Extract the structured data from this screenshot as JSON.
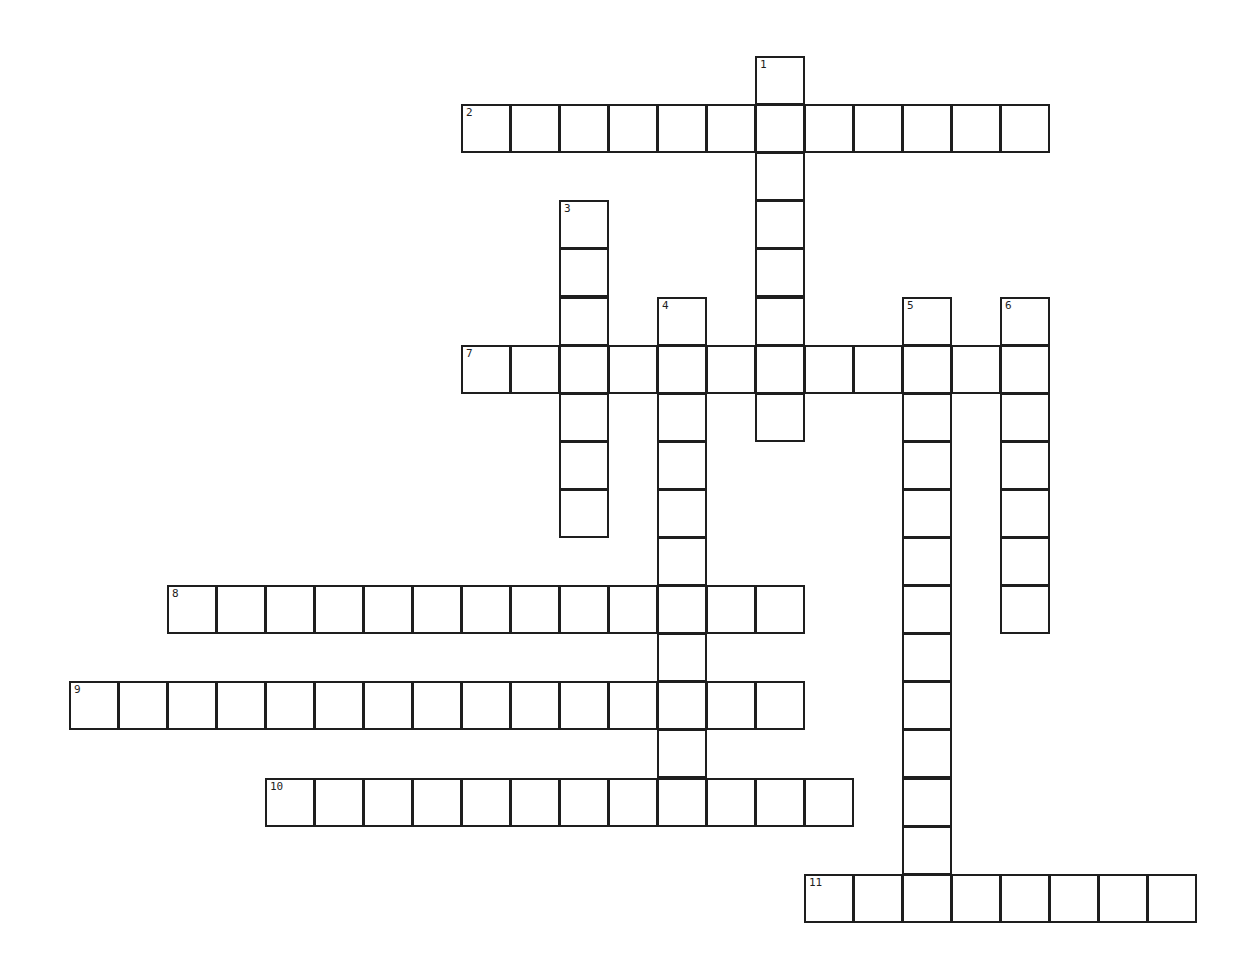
{
  "puzzle": {
    "grid_origin": {
      "x": 69,
      "y": 56
    },
    "cell_w": 49,
    "cell_h": 48.1,
    "words": [
      {
        "number": "1",
        "direction": "down",
        "row": 0,
        "col": 14,
        "length": 8
      },
      {
        "number": "2",
        "direction": "across",
        "row": 1,
        "col": 8,
        "length": 12
      },
      {
        "number": "3",
        "direction": "down",
        "row": 3,
        "col": 10,
        "length": 7
      },
      {
        "number": "4",
        "direction": "down",
        "row": 5,
        "col": 12,
        "length": 10
      },
      {
        "number": "5",
        "direction": "down",
        "row": 5,
        "col": 17,
        "length": 13
      },
      {
        "number": "6",
        "direction": "down",
        "row": 5,
        "col": 19,
        "length": 7
      },
      {
        "number": "7",
        "direction": "across",
        "row": 6,
        "col": 8,
        "length": 12
      },
      {
        "number": "8",
        "direction": "across",
        "row": 11,
        "col": 2,
        "length": 13
      },
      {
        "number": "9",
        "direction": "across",
        "row": 13,
        "col": 0,
        "length": 15
      },
      {
        "number": "10",
        "direction": "across",
        "row": 15,
        "col": 4,
        "length": 12
      },
      {
        "number": "11",
        "direction": "across",
        "row": 17,
        "col": 15,
        "length": 8
      }
    ]
  }
}
